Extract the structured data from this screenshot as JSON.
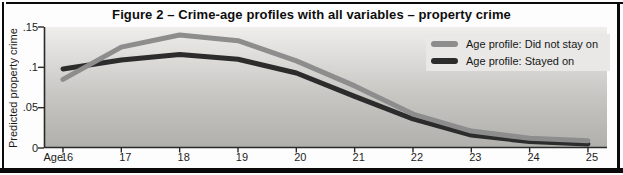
{
  "figure": {
    "title": "Figure 2 – Crime-age profiles with all variables – property crime"
  },
  "chart_data": {
    "type": "line",
    "title": "Figure 2 – Crime-age profiles with all variables – property crime",
    "xlabel": "Age",
    "ylabel": "Predicted property crime",
    "x": [
      16,
      17,
      18,
      19,
      20,
      21,
      22,
      23,
      24,
      25
    ],
    "series": [
      {
        "name": "Age profile: Did not stay on",
        "color": "#8d8d8d",
        "values": [
          0.085,
          0.125,
          0.14,
          0.133,
          0.108,
          0.077,
          0.042,
          0.021,
          0.012,
          0.009
        ]
      },
      {
        "name": "Age profile: Stayed on",
        "color": "#2c2c2c",
        "values": [
          0.098,
          0.109,
          0.116,
          0.11,
          0.093,
          0.064,
          0.036,
          0.016,
          0.008,
          0.005
        ]
      }
    ],
    "ylim": [
      0,
      0.15
    ],
    "yticks": [
      {
        "value": 0,
        "label": "0"
      },
      {
        "value": 0.05,
        "label": ".05"
      },
      {
        "value": 0.1,
        "label": ".1"
      },
      {
        "value": 0.15,
        "label": ".15"
      }
    ],
    "grid": false,
    "legend_position": "top-right",
    "plot_background": "vertical gray gradient"
  },
  "colors": {
    "frame_border": "#0a0a0a",
    "axis": "#2a2a2a",
    "plot_bg_top": "#efeeec",
    "plot_bg_mid": "#c8c7c4",
    "plot_bg_bottom": "#b0afac",
    "legend_bg": "#e9e8e6",
    "text": "#1c1c1c"
  }
}
